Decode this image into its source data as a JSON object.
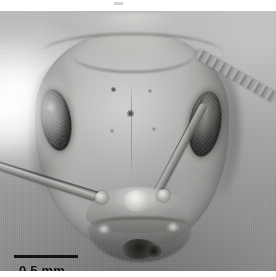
{
  "figure": {
    "kind": "light-micrograph",
    "color_mode": "grayscale",
    "background_color": "#ffffff",
    "plate_color": "#a0a0a0",
    "plate_left": 0,
    "plate_top": 11,
    "plate_width": 276,
    "plate_height": 260
  },
  "scalebar": {
    "label": "0.5 mm",
    "value": "0.5",
    "unit": "mm",
    "bar_color": "#121212",
    "text_color": "#0d0d0d",
    "bar_length_px": 64,
    "position": "bottom-left"
  },
  "anatomy": {
    "head_capsule": "head-capsule",
    "vertex": "vertex-margin",
    "eye_left": "compound-eye-left",
    "eye_right": "compound-eye-right",
    "scape_left": "antennal-scape-left",
    "scape_right": "antennal-scape-right",
    "funiculus": "antennal-funiculus-right",
    "clypeus": "clypeus",
    "mandibles": "mandibles",
    "frontal_pits": "frontal-setal-pits"
  },
  "artifacts": {
    "glare": "specular-highlight-left",
    "speck": "scanner-speck-top"
  }
}
